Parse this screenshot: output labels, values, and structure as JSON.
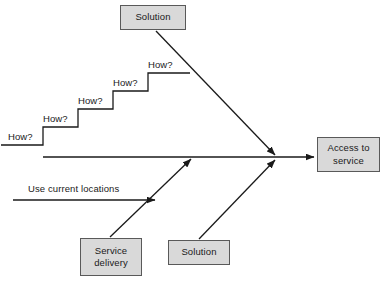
{
  "diagram": {
    "type": "fishbone-cause-effect-diagram",
    "stroke_color": "#1a1a1a",
    "box_fill_color": "#d9d9d9",
    "box_border_color": "#595959",
    "background_color": "#ffffff",
    "boxes": [
      {
        "id": "solution-top",
        "label": "Solution",
        "x": 120,
        "y": 5,
        "w": 66,
        "h": 25
      },
      {
        "id": "service-delivery",
        "label": "Service\ndelivery",
        "x": 80,
        "y": 238,
        "w": 62,
        "h": 38
      },
      {
        "id": "solution-bottom",
        "label": "Solution",
        "x": 168,
        "y": 240,
        "w": 62,
        "h": 25
      },
      {
        "id": "access-to-service",
        "label": "Access to\nservice",
        "x": 317,
        "y": 137,
        "w": 63,
        "h": 35
      }
    ],
    "staircase_labels": [
      {
        "text": "How?",
        "x": 8,
        "y": 131
      },
      {
        "text": "How?",
        "x": 43,
        "y": 113
      },
      {
        "text": "How?",
        "x": 78,
        "y": 95
      },
      {
        "text": "How?",
        "x": 113,
        "y": 77
      },
      {
        "text": "How?",
        "x": 148,
        "y": 59
      }
    ],
    "edge_labels": [
      {
        "text": "Use current locations",
        "x": 28,
        "y": 183
      }
    ],
    "geometry": {
      "staircase_path": "M 1 145 L 43 145 L 43 127 L 78 127 L 78 109 L 113 109 L 113 91 L 148 91 L 148 73 L 190 73",
      "spine_start_x": 43,
      "spine_y": 157,
      "convergence_x": 276,
      "arrow_to_box_x": 313,
      "diagonal_top": {
        "x1": 156,
        "y1": 31,
        "x2": 274,
        "y2": 154
      },
      "diagonal_service_delivery": {
        "x1": 110,
        "y1": 237,
        "x2": 190,
        "y2": 160
      },
      "diagonal_solution_bottom": {
        "x1": 199,
        "y1": 239,
        "x2": 274,
        "y2": 161
      },
      "use_current_locations_arrow": {
        "x1": 13,
        "y1": 200,
        "x2": 155,
        "y2": 200
      }
    }
  }
}
